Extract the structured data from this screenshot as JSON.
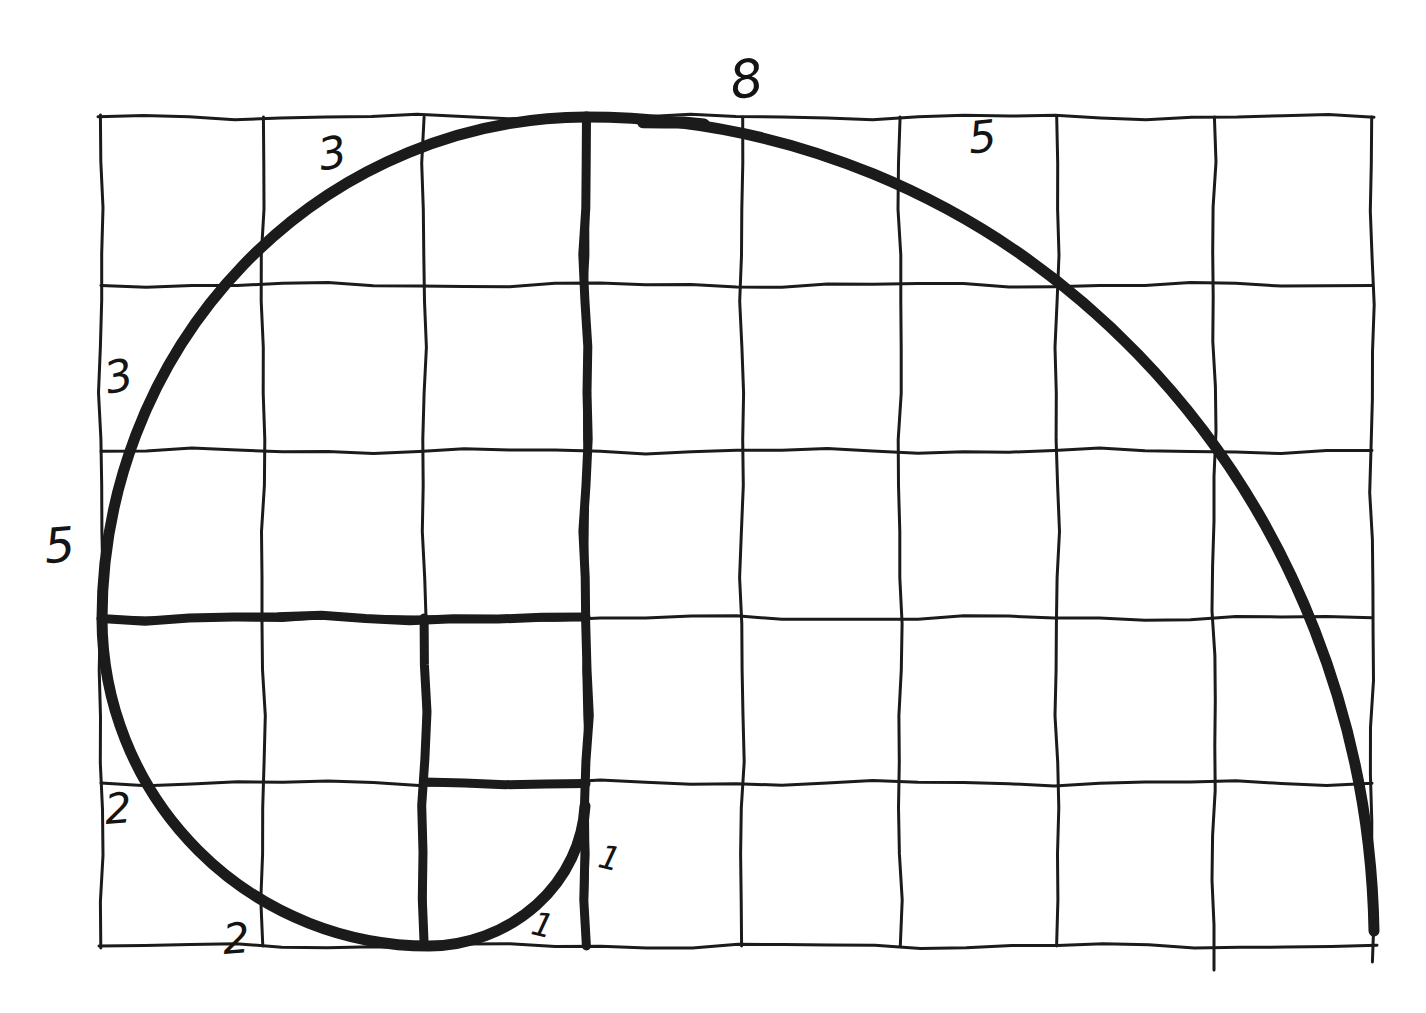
{
  "canvas": {
    "width": 1426,
    "height": 1013,
    "background_color": "#ffffff",
    "ink_color": "#1b1b1b",
    "label_color": "#141414"
  },
  "figure": {
    "figure_type": "hand-drawn-fibonacci-spiral-grid",
    "grid": {
      "columns": 8,
      "rows": 5,
      "left": 101,
      "top": 117,
      "right": 1372,
      "bottom": 946,
      "stroke_width": 3,
      "vertical_lines": [
        {
          "x": 101,
          "y1": 115,
          "y2": 948
        },
        {
          "x": 263,
          "y1": 117,
          "y2": 946
        },
        {
          "x": 424,
          "y1": 117,
          "y2": 946
        },
        {
          "x": 586,
          "y1": 117,
          "y2": 946
        },
        {
          "x": 742,
          "y1": 117,
          "y2": 946
        },
        {
          "x": 900,
          "y1": 117,
          "y2": 946
        },
        {
          "x": 1057,
          "y1": 117,
          "y2": 946
        },
        {
          "x": 1214,
          "y1": 117,
          "y2": 970
        },
        {
          "x": 1372,
          "y1": 117,
          "y2": 962
        }
      ],
      "horizontal_lines": [
        {
          "y": 117,
          "x1": 98,
          "x2": 1374
        },
        {
          "y": 285,
          "x1": 101,
          "x2": 1372
        },
        {
          "y": 451,
          "x1": 101,
          "x2": 1372
        },
        {
          "y": 618,
          "x1": 101,
          "x2": 1372
        },
        {
          "y": 783,
          "x1": 101,
          "x2": 1372
        },
        {
          "y": 946,
          "x1": 99,
          "x2": 1377
        }
      ]
    },
    "dividers": {
      "stroke_width": 9,
      "lines": [
        {
          "name": "divider-5-square-vertical",
          "x1": 586,
          "y1": 116,
          "x2": 586,
          "y2": 946
        },
        {
          "name": "divider-3-square-horizontal",
          "x1": 101,
          "y1": 618,
          "x2": 586,
          "y2": 618
        },
        {
          "name": "divider-2-square-vertical",
          "x1": 424,
          "y1": 618,
          "x2": 424,
          "y2": 946
        },
        {
          "name": "divider-1-square-horizontal",
          "x1": 424,
          "y1": 783,
          "x2": 586,
          "y2": 783
        }
      ]
    },
    "spiral": {
      "stroke_width": 11,
      "start": {
        "x": 1374,
        "y": 931
      },
      "arcs": [
        {
          "square": "5x5",
          "rx": 788,
          "ry": 829,
          "end_x": 586,
          "end_y": 117
        },
        {
          "square": "3x3",
          "rx": 486,
          "ry": 502,
          "end_x": 102,
          "end_y": 619
        },
        {
          "square": "2x2",
          "rx": 327,
          "ry": 328,
          "end_x": 429,
          "end_y": 946
        },
        {
          "square": "1x1",
          "rx": 158,
          "ry": 148,
          "end_x": 585,
          "end_y": 806
        }
      ],
      "overlap_dash": {
        "x1": 643,
        "y1": 122,
        "x2": 704,
        "y2": 125,
        "stroke_width": 12
      }
    },
    "labels": [
      {
        "name": "label-8-top",
        "text": "8",
        "value": 8,
        "x": 749,
        "y": 97,
        "size": 52,
        "rotate": -8
      },
      {
        "name": "label-5-top-right",
        "text": "5",
        "value": 5,
        "x": 984,
        "y": 152,
        "size": 44,
        "rotate": -6
      },
      {
        "name": "label-3-top-left",
        "text": "3",
        "value": 3,
        "x": 335,
        "y": 168,
        "size": 44,
        "rotate": -10
      },
      {
        "name": "label-3-left",
        "text": "3",
        "value": 3,
        "x": 122,
        "y": 391,
        "size": 44,
        "rotate": -12
      },
      {
        "name": "label-5-left",
        "text": "5",
        "value": 5,
        "x": 61,
        "y": 562,
        "size": 48,
        "rotate": -5
      },
      {
        "name": "label-2-left",
        "text": "2",
        "value": 2,
        "x": 119,
        "y": 823,
        "size": 42,
        "rotate": -4
      },
      {
        "name": "label-2-bottom",
        "text": "2",
        "value": 2,
        "x": 237,
        "y": 953,
        "size": 42,
        "rotate": -4
      },
      {
        "name": "label-1-right",
        "text": "1",
        "value": 1,
        "x": 607,
        "y": 869,
        "size": 33,
        "rotate": 14
      },
      {
        "name": "label-1-inner",
        "text": "1",
        "value": 1,
        "x": 540,
        "y": 936,
        "size": 33,
        "rotate": 14
      }
    ]
  }
}
